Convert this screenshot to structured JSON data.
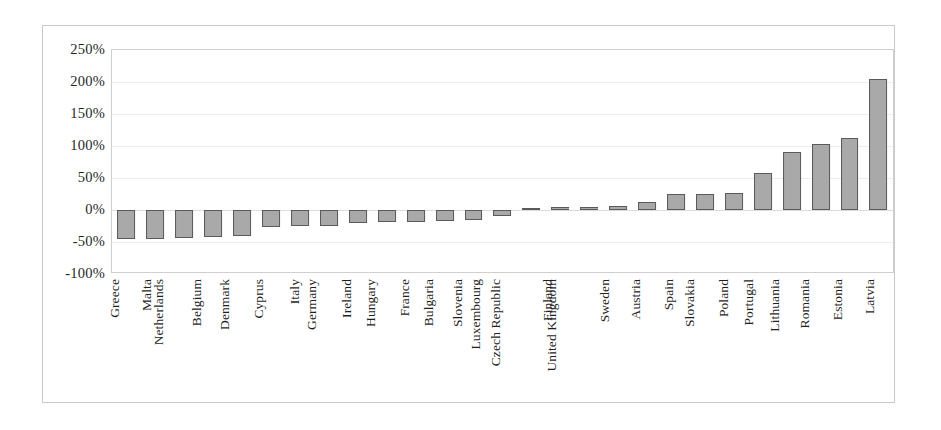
{
  "chart_data": {
    "type": "bar",
    "title": "",
    "subtitle": "",
    "xlabel": "",
    "ylabel": "",
    "ylim": [
      -100,
      250
    ],
    "ytick_labels": [
      "250%",
      "200%",
      "150%",
      "100%",
      "50%",
      "0%",
      "-50%",
      "-100%"
    ],
    "ytick_values": [
      250,
      200,
      150,
      100,
      50,
      0,
      -50,
      -100
    ],
    "grid": true,
    "legend": null,
    "bar_fill_color": "#a9a9a9",
    "bar_border_color": "#5a5a5a",
    "categories": [
      "Greece",
      "Malta",
      "Netherlands",
      "Belgium",
      "Denmark",
      "Cyprus",
      "Italy",
      "Germany",
      "Ireland",
      "Hungary",
      "France",
      "Bulgaria",
      "Slovenia",
      "Luxembourg",
      "Czech Republic",
      "Finland",
      "United Kingdom",
      "Sweden",
      "Austria",
      "Spain",
      "Slovakia",
      "Poland",
      "Portugal",
      "Lithuania",
      "Romania",
      "Estonia",
      "Latvia"
    ],
    "values": [
      -45,
      -45,
      -43,
      -42,
      -40,
      -27,
      -25,
      -25,
      -20,
      -19,
      -18,
      -17,
      -16,
      -10,
      3,
      4,
      4,
      6,
      12,
      25,
      25,
      26,
      58,
      90,
      103,
      113,
      205
    ]
  }
}
